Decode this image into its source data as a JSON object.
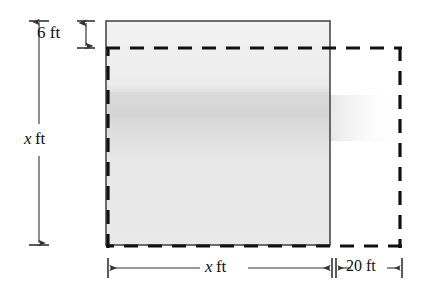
{
  "figure": {
    "type": "geometry-diagram",
    "canvas": {
      "width": 424,
      "height": 286,
      "background": "#ffffff"
    },
    "colors": {
      "solid_stroke": "#4a4a4a",
      "dashed_stroke": "#111111",
      "fill": "#e8e8e8",
      "fill_band": "#d8d8d8",
      "dimension_line": "#333333",
      "text": "#111111"
    },
    "shapes": {
      "solid_rectangle": {
        "name": "original-square-region",
        "style": "solid",
        "filled": true,
        "x": 106,
        "y": 21,
        "width": 224,
        "height": 224
      },
      "dashed_rectangle": {
        "name": "enlarged-region",
        "style": "dashed",
        "filled": false,
        "x": 108,
        "y": 48,
        "width": 293,
        "height": 199,
        "dash_length": 14,
        "dash_gap": 10,
        "stroke_width": 3
      }
    },
    "dimensions": [
      {
        "id": "six-ft",
        "value": "6",
        "unit": "ft",
        "label_var": "",
        "orientation": "vertical",
        "position": "top-left",
        "from_y": 21,
        "to_y": 48,
        "description": "vertical offset between solid top edge and dashed top edge"
      },
      {
        "id": "left-x-ft",
        "value": "x",
        "unit": "ft",
        "label_var": "x",
        "orientation": "vertical",
        "position": "left",
        "from_y": 21,
        "to_y": 245,
        "description": "height of the solid square region"
      },
      {
        "id": "bottom-x-ft",
        "value": "x",
        "unit": "ft",
        "label_var": "x",
        "orientation": "horizontal",
        "position": "bottom",
        "from_x": 108,
        "to_x": 332,
        "description": "width of the solid square region"
      },
      {
        "id": "twenty-ft",
        "value": "20",
        "unit": "ft",
        "label_var": "",
        "orientation": "horizontal",
        "position": "bottom-right",
        "from_x": 335,
        "to_x": 402,
        "description": "horizontal extension of the dashed region beyond the solid region"
      }
    ]
  },
  "labels": {
    "six_ft": {
      "var": "",
      "number": "6",
      "unit": "ft",
      "full": "6 ft"
    },
    "left_x_ft": {
      "var": "x",
      "number": "",
      "unit": "ft",
      "full": "x ft"
    },
    "bottom_x_ft": {
      "var": "x",
      "number": "",
      "unit": "ft",
      "full": "x ft"
    },
    "twenty_ft": {
      "var": "",
      "number": "20",
      "unit": "ft",
      "full": "20 ft"
    }
  }
}
